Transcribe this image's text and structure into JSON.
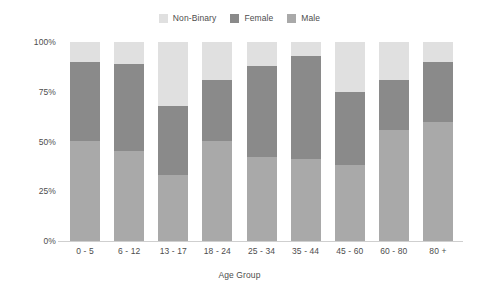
{
  "chart_data": {
    "type": "bar",
    "subtype": "stacked-percentage",
    "title": "",
    "xlabel": "Age Group",
    "ylabel": "",
    "categories": [
      "0 - 5",
      "6 - 12",
      "13 - 17",
      "18 - 24",
      "25 - 34",
      "35 - 44",
      "45 - 60",
      "60 - 80",
      "80 +"
    ],
    "series": [
      {
        "name": "Male",
        "color": "#a9a9a9",
        "values": [
          50,
          45,
          33,
          50,
          42,
          41,
          38,
          56,
          60
        ]
      },
      {
        "name": "Female",
        "color": "#8a8a8a",
        "values": [
          40,
          44,
          35,
          31,
          46,
          52,
          37,
          25,
          30
        ]
      },
      {
        "name": "Non-Binary",
        "color": "#e0e0e0",
        "values": [
          10,
          11,
          32,
          19,
          12,
          7,
          25,
          19,
          10
        ]
      }
    ],
    "stack_order_bottom_to_top": [
      "Male",
      "Female",
      "Non-Binary"
    ],
    "legend_order": [
      "Non-Binary",
      "Female",
      "Male"
    ],
    "legend_position": "top-center",
    "ylim": [
      0,
      100
    ],
    "yticks": [
      "0%",
      "25%",
      "50%",
      "75%",
      "100%"
    ],
    "ytick_values": [
      0,
      25,
      50,
      75,
      100
    ],
    "grid": false,
    "background_color": "#ffffff",
    "axis_color": "#cfcfcf",
    "text_color": "#4d4d4d"
  }
}
